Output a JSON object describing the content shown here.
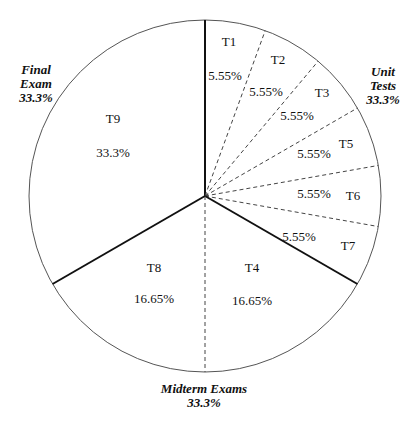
{
  "chart_data": {
    "type": "pie",
    "title": "",
    "start_angle_deg": 0,
    "direction": "clockwise",
    "slices": [
      {
        "name": "T1",
        "value": 5.55,
        "label": "5.55%",
        "group": "Unit Tests"
      },
      {
        "name": "T2",
        "value": 5.55,
        "label": "5.55%",
        "group": "Unit Tests"
      },
      {
        "name": "T3",
        "value": 5.55,
        "label": "5.55%",
        "group": "Unit Tests"
      },
      {
        "name": "T5",
        "value": 5.55,
        "label": "5.55%",
        "group": "Unit Tests"
      },
      {
        "name": "T6",
        "value": 5.55,
        "label": "5.55%",
        "group": "Unit Tests"
      },
      {
        "name": "T7",
        "value": 5.55,
        "label": "5.55%",
        "group": "Unit Tests"
      },
      {
        "name": "T4",
        "value": 16.65,
        "label": "16.65%",
        "group": "Midterm Exams"
      },
      {
        "name": "T8",
        "value": 16.65,
        "label": "16.65%",
        "group": "Midterm Exams"
      },
      {
        "name": "T9",
        "value": 33.3,
        "label": "33.3%",
        "group": "Final Exam"
      }
    ],
    "groups": [
      {
        "name": "Unit Tests",
        "lines": [
          "Unit",
          "Tests",
          "33.3%"
        ],
        "value": 33.3,
        "position": "upper-right"
      },
      {
        "name": "Midterm Exams",
        "lines": [
          "Midterm Exams",
          "33.3%"
        ],
        "value": 33.3,
        "position": "bottom"
      },
      {
        "name": "Final Exam",
        "lines": [
          "Final",
          "Exam",
          "33.3%"
        ],
        "value": 33.3,
        "position": "upper-left"
      }
    ],
    "group_boundary_style": "solid-thick",
    "slice_boundary_style": "dashed",
    "colors": {
      "stroke": "#222222",
      "fill": "#ffffff",
      "text": "#111111"
    }
  }
}
